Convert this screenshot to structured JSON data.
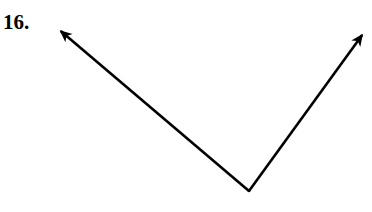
{
  "figure": {
    "problem_number": "16.",
    "background_color": "#ffffff",
    "ink_color": "#000000",
    "width": 372,
    "height": 212,
    "label_position": {
      "x": 3,
      "y": 12
    },
    "stroke_width": 2.6,
    "vertex": {
      "x": 249,
      "y": 191
    },
    "rays": [
      {
        "name": "left-ray",
        "from": {
          "x": 249,
          "y": 191
        },
        "to": {
          "x": 57,
          "y": 28
        },
        "arrowhead": "filled-barb",
        "direction": "up-left"
      },
      {
        "name": "right-ray",
        "from": {
          "x": 249,
          "y": 191
        },
        "to": {
          "x": 365,
          "y": 31
        },
        "arrowhead": "filled-barb",
        "direction": "up-right"
      }
    ]
  }
}
